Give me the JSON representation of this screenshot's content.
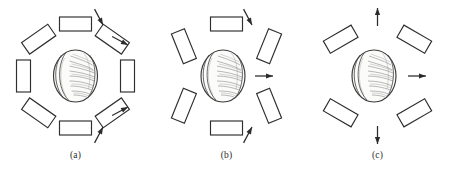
{
  "figure": {
    "background_color": "#ffffff",
    "ink_color": "#2b2b2b"
  },
  "panels": [
    {
      "id": "a",
      "caption": "(a)",
      "center_object": "walnut",
      "element_count": 8,
      "arrow_count": 4,
      "elements": [
        {
          "name": "element-top",
          "angle_deg": 90,
          "rotation_deg": 0,
          "radius": 52
        },
        {
          "name": "element-upper-left",
          "angle_deg": 135,
          "rotation_deg": -35,
          "radius": 52
        },
        {
          "name": "element-left",
          "angle_deg": 180,
          "rotation_deg": 90,
          "radius": 52
        },
        {
          "name": "element-lower-left",
          "angle_deg": 225,
          "rotation_deg": 35,
          "radius": 52
        },
        {
          "name": "element-bottom",
          "angle_deg": 270,
          "rotation_deg": 0,
          "radius": 52
        },
        {
          "name": "element-lower-right",
          "angle_deg": 315,
          "rotation_deg": -35,
          "radius": 52
        },
        {
          "name": "element-right",
          "angle_deg": 0,
          "rotation_deg": 90,
          "radius": 52
        },
        {
          "name": "element-upper-right",
          "angle_deg": 45,
          "rotation_deg": 35,
          "radius": 52
        }
      ],
      "arrows": [
        {
          "name": "arrow-upper-right-outer",
          "angle_deg": 62,
          "direction_deg": 242,
          "length": 18
        },
        {
          "name": "arrow-right-upper",
          "angle_deg": 28,
          "direction_deg": 208,
          "length": 18
        },
        {
          "name": "arrow-right-lower",
          "angle_deg": -22,
          "direction_deg": 158,
          "length": 18
        },
        {
          "name": "arrow-lower-right-outer",
          "angle_deg": -62,
          "direction_deg": 118,
          "length": 18
        }
      ]
    },
    {
      "id": "b",
      "caption": "(b)",
      "center_object": "walnut",
      "element_count": 6,
      "arrow_count": 3,
      "elements": [
        {
          "name": "element-top",
          "angle_deg": 90,
          "rotation_deg": 0,
          "radius": 52
        },
        {
          "name": "element-upper-left",
          "angle_deg": 145,
          "rotation_deg": 68,
          "radius": 52
        },
        {
          "name": "element-lower-left",
          "angle_deg": 215,
          "rotation_deg": 112,
          "radius": 52
        },
        {
          "name": "element-bottom",
          "angle_deg": 270,
          "rotation_deg": 0,
          "radius": 52
        },
        {
          "name": "element-lower-right",
          "angle_deg": 325,
          "rotation_deg": 68,
          "radius": 52
        },
        {
          "name": "element-upper-right",
          "angle_deg": 35,
          "rotation_deg": 112,
          "radius": 52
        }
      ],
      "arrows": [
        {
          "name": "arrow-upper-right",
          "angle_deg": 62,
          "direction_deg": 242,
          "length": 18
        },
        {
          "name": "arrow-right",
          "angle_deg": 0,
          "direction_deg": 180,
          "length": 22
        },
        {
          "name": "arrow-lower-right",
          "angle_deg": -62,
          "direction_deg": 118,
          "length": 18
        }
      ]
    },
    {
      "id": "c",
      "caption": "(c)",
      "center_object": "walnut",
      "element_count": 4,
      "arrow_count": 3,
      "elements": [
        {
          "name": "element-upper-left",
          "angle_deg": 135,
          "rotation_deg": -30,
          "radius": 52
        },
        {
          "name": "element-lower-left",
          "angle_deg": 225,
          "rotation_deg": 30,
          "radius": 52
        },
        {
          "name": "element-lower-right",
          "angle_deg": 315,
          "rotation_deg": -30,
          "radius": 52
        },
        {
          "name": "element-upper-right",
          "angle_deg": 45,
          "rotation_deg": 30,
          "radius": 52
        }
      ],
      "arrows": [
        {
          "name": "arrow-top",
          "angle_deg": 90,
          "direction_deg": 270,
          "length": 24
        },
        {
          "name": "arrow-right",
          "angle_deg": 0,
          "direction_deg": 180,
          "length": 24
        },
        {
          "name": "arrow-bottom",
          "angle_deg": 270,
          "direction_deg": 90,
          "length": 24
        }
      ]
    }
  ]
}
